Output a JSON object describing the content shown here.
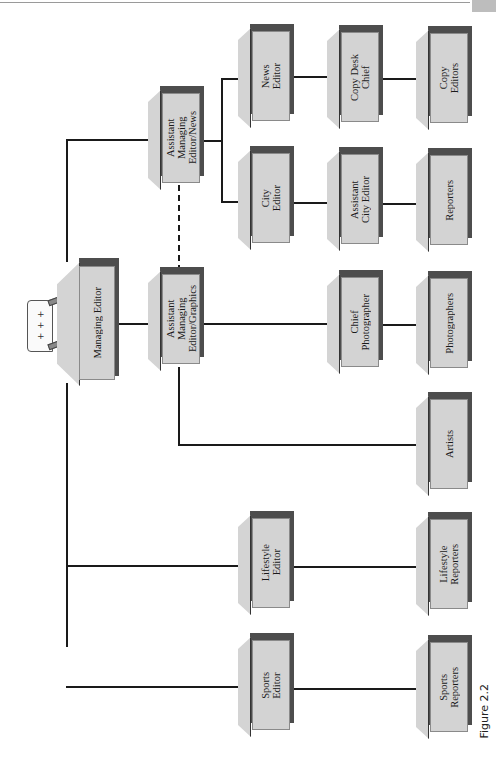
{
  "figure": {
    "caption": "Figure 2.2",
    "orientation": "rotated 90° counter-clockwise (page landscape)"
  },
  "org_chart": {
    "root": {
      "id": "managing-editor",
      "label": "Managing Editor",
      "children": [
        {
          "id": "ame-news",
          "label": "Assistant\nManaging\nEditor/News",
          "children": [
            {
              "id": "news-editor",
              "label": "News\nEditor",
              "children": [
                {
                  "id": "copy-desk-chief",
                  "label": "Copy Desk\nChief",
                  "children": [
                    {
                      "id": "copy-editors",
                      "label": "Copy\nEditors"
                    }
                  ]
                }
              ]
            },
            {
              "id": "city-editor",
              "label": "City\nEditor",
              "children": [
                {
                  "id": "asst-city-editor",
                  "label": "Assistant\nCity Editor",
                  "children": [
                    {
                      "id": "reporters",
                      "label": "Reporters"
                    }
                  ]
                }
              ]
            }
          ]
        },
        {
          "id": "ame-graphics",
          "label": "Assistant\nManaging\nEditor/Graphics",
          "children": [
            {
              "id": "chief-photographer",
              "label": "Chief\nPhotographer",
              "children": [
                {
                  "id": "photographers",
                  "label": "Photographers"
                }
              ]
            },
            {
              "id": "artists",
              "label": "Artists"
            }
          ]
        },
        {
          "id": "lifestyle-editor",
          "label": "Lifestyle\nEditor",
          "children": [
            {
              "id": "lifestyle-reporters",
              "label": "Lifestyle\nReporters"
            }
          ]
        },
        {
          "id": "sports-editor",
          "label": "Sports\nEditor",
          "children": [
            {
              "id": "sports-reporters",
              "label": "Sports\nReporters"
            }
          ]
        }
      ]
    },
    "dotted_links": [
      {
        "from": "ame-news",
        "to": "ame-graphics",
        "style": "dashed"
      }
    ]
  },
  "labels": {
    "managing_editor": "Managing Editor",
    "ame_news": "Assistant\nManaging\nEditor/News",
    "ame_graphics": "Assistant\nManaging\nEditor/Graphics",
    "news_editor": "News\nEditor",
    "copy_desk_chief": "Copy Desk\nChief",
    "copy_editors": "Copy\nEditors",
    "city_editor": "City\nEditor",
    "asst_city_editor": "Assistant\nCity Editor",
    "reporters": "Reporters",
    "chief_photographer": "Chief\nPhotographer",
    "photographers": "Photographers",
    "artists": "Artists",
    "lifestyle_editor": "Lifestyle\nEditor",
    "lifestyle_reporters": "Lifestyle\nReporters",
    "sports_editor": "Sports\nEditor",
    "sports_reporters": "Sports\nReporters",
    "printer_marks": "+ + +"
  },
  "colors": {
    "box_fill": "#d3d3d3",
    "box_shadow": "#4d4d4d",
    "connector": "#1a1a1a",
    "background": "#ffffff"
  }
}
